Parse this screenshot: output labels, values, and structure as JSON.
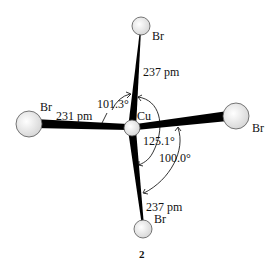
{
  "diagram": {
    "central_atom": "Cu",
    "ligands": [
      {
        "id": "top",
        "element": "Br"
      },
      {
        "id": "left",
        "element": "Br"
      },
      {
        "id": "right",
        "element": "Br"
      },
      {
        "id": "bottom",
        "element": "Br"
      }
    ],
    "bond_lengths": {
      "top": "237 pm",
      "left": "231 pm",
      "bottom": "237 pm"
    },
    "angles": {
      "top_left": "101.3°",
      "top_bottom_right": "125.1°",
      "right_bottom": "100.0°"
    },
    "compound_number": "2",
    "colors": {
      "atom_fill": "#e6e6e6",
      "bond": "#000000"
    }
  }
}
